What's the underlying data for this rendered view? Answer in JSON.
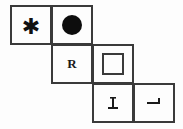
{
  "puzzle": {
    "type": "figure-matrix-staircase",
    "background_color": "#fdfdfd",
    "cell_border_color": "#3a3a3a",
    "ink_color": "#111111",
    "rows": 3,
    "columns": 4,
    "cells": [
      {
        "id": "r1c1",
        "row": 1,
        "column": 1,
        "content_kind": "asterisk-glyph",
        "content_text": "✱",
        "label": "asterisk"
      },
      {
        "id": "r1c2",
        "row": 1,
        "column": 2,
        "content_kind": "filled-circle",
        "content_text": "",
        "label": "filled circle"
      },
      {
        "id": "r2c2",
        "row": 2,
        "column": 2,
        "content_kind": "letter",
        "content_text": "R",
        "label": "letter R"
      },
      {
        "id": "r2c3",
        "row": 2,
        "column": 3,
        "content_kind": "hollow-square",
        "content_text": "",
        "label": "empty square outline"
      },
      {
        "id": "r3c3",
        "row": 3,
        "column": 3,
        "content_kind": "rotated-letter",
        "content_text": "⊥",
        "label": "rotated T / perpendicular mark"
      },
      {
        "id": "r3c4",
        "row": 3,
        "column": 4,
        "content_kind": "rotated-letter",
        "content_text": "⌐",
        "label": "rotated L / corner mark"
      }
    ]
  }
}
